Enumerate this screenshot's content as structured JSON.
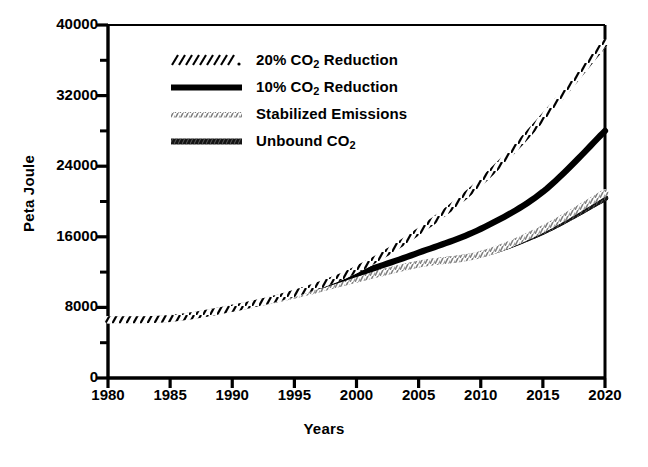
{
  "chart_data": {
    "type": "line",
    "title": "",
    "xlabel": "Years",
    "ylabel": "Peta Joule",
    "xlim": [
      1980,
      2020
    ],
    "ylim": [
      0,
      40000
    ],
    "x_ticks": [
      "1980",
      "1985",
      "1990",
      "1995",
      "2000",
      "2005",
      "2010",
      "2015",
      "2020"
    ],
    "y_ticks": [
      "0",
      "8000",
      "16000",
      "24000",
      "32000",
      "40000"
    ],
    "y_minor_ticks": [
      4000,
      12000,
      20000,
      28000,
      36000
    ],
    "grid": false,
    "legend_position": "upper-left-inside",
    "x": [
      1980,
      1985,
      1990,
      1995,
      2000,
      2005,
      2010,
      2015,
      2020
    ],
    "series": [
      {
        "name": "20% CO2 Reduction",
        "label_prefix": "20% CO",
        "label_sub": "2",
        "label_suffix": " Reduction",
        "style": "hatched-dashed",
        "color": "#111111",
        "values": [
          6600,
          6750,
          7900,
          9600,
          12300,
          16600,
          22200,
          29500,
          38000
        ]
      },
      {
        "name": "10% CO2 Reduction",
        "label_prefix": "10% CO",
        "label_sub": "2",
        "label_suffix": " Reduction",
        "style": "thick-solid",
        "color": "#000000",
        "values": [
          6600,
          6750,
          7900,
          9600,
          11800,
          14200,
          16900,
          21100,
          28000
        ]
      },
      {
        "name": "Stabilized Emissions",
        "label_prefix": "Stabilized Emissions",
        "label_sub": "",
        "label_suffix": "",
        "style": "stipple-light",
        "color": "#8a8a8a",
        "values": [
          6600,
          6750,
          7900,
          9400,
          11200,
          12900,
          14000,
          16900,
          21000
        ]
      },
      {
        "name": "Unbound CO2",
        "label_prefix": "Unbound CO",
        "label_sub": "2",
        "label_suffix": "",
        "style": "thick-textured",
        "color": "#1a1a1a",
        "values": [
          6600,
          6750,
          7900,
          9400,
          11200,
          12900,
          14000,
          16600,
          20400
        ]
      }
    ]
  },
  "axis": {
    "ylabel": "Peta Joule",
    "xlabel": "Years"
  }
}
